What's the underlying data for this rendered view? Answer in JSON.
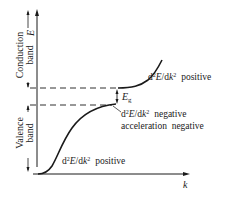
{
  "diagram": {
    "colors": {
      "ink": "#1a1a1a",
      "background": "#ffffff"
    },
    "axes": {
      "y_label": "E",
      "x_label": "k"
    },
    "bands": {
      "conduction": {
        "line1": "Conduction",
        "line2": "band"
      },
      "valence": {
        "line1": "Valence",
        "line2": "band"
      }
    },
    "gap": {
      "label_main": "E",
      "label_sub": "g"
    },
    "annotations": {
      "conduction_curvature": {
        "d2": "d",
        "sup2": "2",
        "E": "E",
        "slash_dk": "/d",
        "k": "k",
        "sup2b": "2",
        "text": "positive"
      },
      "valence_top_curvature": {
        "d2": "d",
        "sup2": "2",
        "E": "E",
        "slash_dk": "/d",
        "k": "k",
        "sup2b": "2",
        "text": "negative",
        "line2": "acceleration  negative"
      },
      "valence_bottom_curvature": {
        "d2": "d",
        "sup2": "2",
        "E": "E",
        "slash_dk": "/d",
        "k": "k",
        "sup2b": "2",
        "text": "positive"
      }
    }
  }
}
